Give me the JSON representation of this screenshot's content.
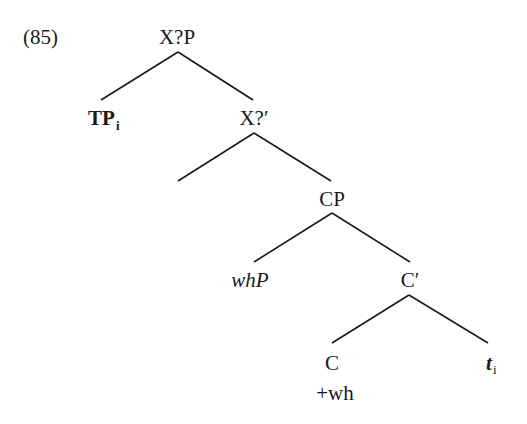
{
  "example_number": "(85)",
  "tree": {
    "root": {
      "label": "X?P"
    },
    "spec_root": {
      "label": "TP",
      "subscript": "i"
    },
    "bar_x": {
      "label": "X?′"
    },
    "cp": {
      "label": "CP"
    },
    "spec_cp": {
      "label": "whP"
    },
    "c_bar": {
      "label": "C′"
    },
    "c_head": {
      "label": "C",
      "feature": "+wh"
    },
    "trace": {
      "label": "t",
      "subscript": "i"
    }
  }
}
